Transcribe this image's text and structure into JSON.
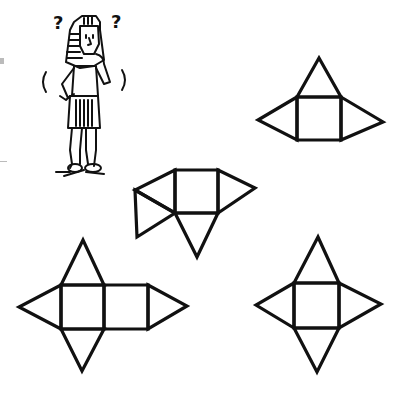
{
  "figure": {
    "character": "confused-pharaoh",
    "marks": [
      "?",
      "?"
    ]
  },
  "nets": [
    {
      "id": "net-a",
      "description": "square with three triangles (top, left, right)",
      "position": "top-right"
    },
    {
      "id": "net-b",
      "description": "square with four triangles, two attached on left side",
      "position": "middle"
    },
    {
      "id": "net-c",
      "description": "two squares with four triangles",
      "position": "bottom-left"
    },
    {
      "id": "net-d",
      "description": "square with four triangles (star net)",
      "position": "bottom-right"
    }
  ],
  "colors": {
    "stroke": "#111111",
    "background": "#ffffff"
  }
}
